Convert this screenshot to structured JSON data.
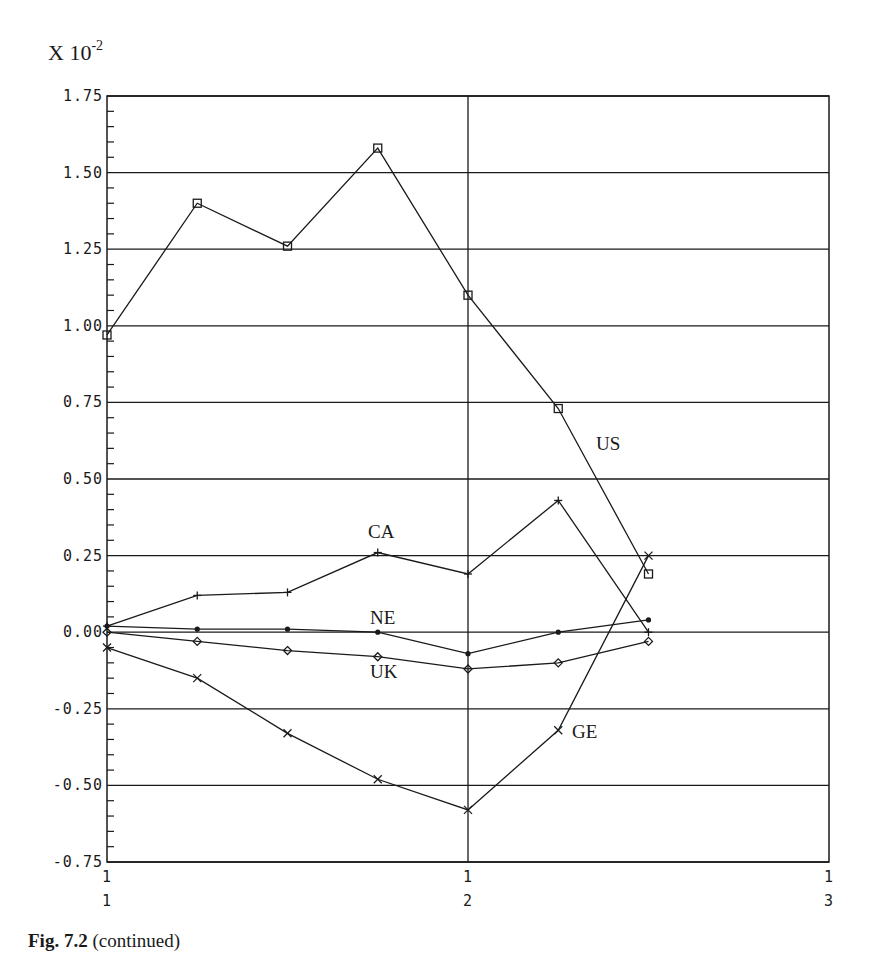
{
  "figure": {
    "caption_bold": "Fig. 7.2",
    "caption_rest": " (continued)",
    "y_multiplier_base": "X 10",
    "y_multiplier_exp": "-2"
  },
  "chart_data": {
    "type": "line",
    "title": "",
    "xlabel": "",
    "ylabel": "X 10^-2",
    "y_scale_note": "values multiplied by 10^-2",
    "ylim": [
      -0.75,
      1.75
    ],
    "yticks": [
      "1.75",
      "1.50",
      "1.25",
      "1.00",
      "0.75",
      "0.50",
      "0.25",
      "0.00",
      "-0.25",
      "-0.50",
      "-0.75"
    ],
    "ytick_values": [
      1.75,
      1.5,
      1.25,
      1.0,
      0.75,
      0.5,
      0.25,
      0.0,
      -0.25,
      -0.5,
      -0.75
    ],
    "y_minor_ticks_per_major": 4,
    "xlim": [
      0,
      8
    ],
    "xticks": [
      {
        "pos": 0,
        "top": "1",
        "bottom": "1"
      },
      {
        "pos": 4,
        "top": "1",
        "bottom": "2"
      },
      {
        "pos": 8,
        "top": "1",
        "bottom": "3"
      }
    ],
    "grid": {
      "horizontal": true,
      "vertical_at": [
        4
      ]
    },
    "x": [
      0,
      1,
      2,
      3,
      4,
      5,
      6
    ],
    "series": [
      {
        "name": "US",
        "marker": "square",
        "values": [
          0.97,
          1.4,
          1.26,
          1.58,
          1.1,
          0.73,
          0.19
        ],
        "label_pos": [
          596,
          450
        ]
      },
      {
        "name": "CA",
        "marker": "plus",
        "values": [
          0.02,
          0.12,
          0.13,
          0.26,
          0.19,
          0.43,
          0.0
        ],
        "label_pos": [
          368,
          538
        ]
      },
      {
        "name": "NE",
        "marker": "dot",
        "values": [
          0.02,
          0.01,
          0.01,
          0.0,
          -0.07,
          0.0,
          0.04
        ],
        "label_pos": [
          370,
          624
        ]
      },
      {
        "name": "UK",
        "marker": "diamond",
        "values": [
          0.0,
          -0.03,
          -0.06,
          -0.08,
          -0.12,
          -0.1,
          -0.03
        ],
        "label_pos": [
          370,
          678
        ]
      },
      {
        "name": "GE",
        "marker": "cross",
        "values": [
          -0.05,
          -0.15,
          -0.33,
          -0.48,
          -0.58,
          -0.32,
          0.25
        ],
        "label_pos": [
          572,
          738
        ]
      }
    ],
    "legend": "inline labels next to series"
  }
}
